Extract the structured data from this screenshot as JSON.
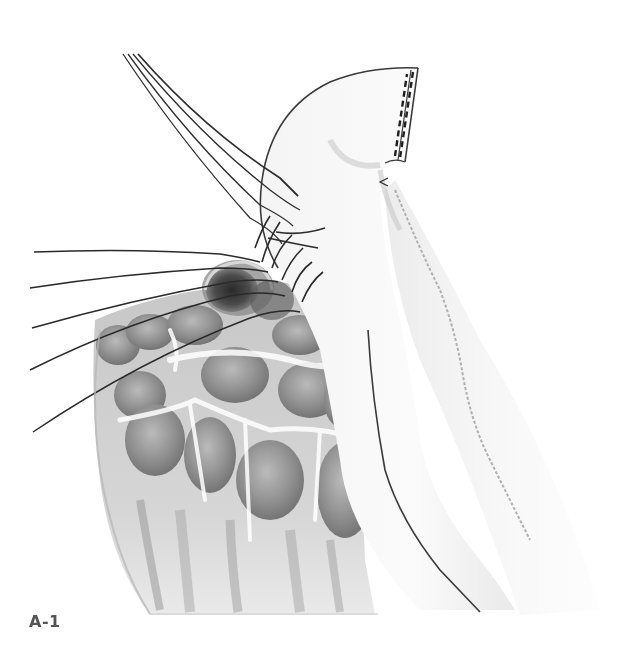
{
  "figure": {
    "label": "A-1",
    "colors": {
      "background": "#ffffff",
      "line": "#2a2a2a",
      "tissue_dark": "#6e6e6e",
      "tissue_mid": "#9a9a9a",
      "tissue_light": "#c8c8c8",
      "label": "#555555"
    }
  }
}
